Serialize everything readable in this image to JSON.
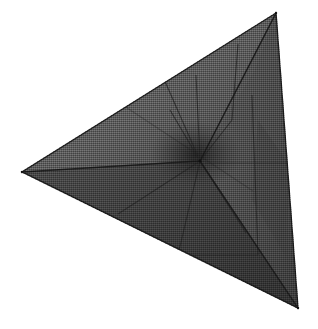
{
  "scene": {
    "title": "Shaded tetrahedron wireframe render",
    "object_name": "tetrahedron",
    "render_style": "flat-shaded-dithered",
    "background_color": "#ffffff",
    "canvas_width": 318,
    "canvas_height": 329
  },
  "geometry": {
    "outline_points": "276,13 22,172 298,308",
    "vertices": [
      {
        "name": "apex-top",
        "x": 276,
        "y": 13
      },
      {
        "name": "vertex-left",
        "x": 22,
        "y": 172
      },
      {
        "name": "vertex-bottom-right",
        "x": 298,
        "y": 308
      },
      {
        "name": "vertex-center-interior",
        "x": 200,
        "y": 161
      }
    ],
    "silhouette_edges": [
      {
        "name": "edge-top-left",
        "from": [
          276,
          13
        ],
        "to": [
          22,
          172
        ]
      },
      {
        "name": "edge-left-bottom",
        "from": [
          22,
          172
        ],
        "to": [
          298,
          308
        ]
      },
      {
        "name": "edge-right",
        "from": [
          298,
          308
        ],
        "to": [
          276,
          13
        ]
      }
    ],
    "interior_edges": [
      {
        "name": "spoke-center-to-left",
        "from": [
          200,
          161
        ],
        "to": [
          22,
          172
        ]
      },
      {
        "name": "spoke-center-to-top",
        "from": [
          200,
          161
        ],
        "to": [
          276,
          13
        ]
      },
      {
        "name": "spoke-center-to-bottom-right",
        "from": [
          200,
          161
        ],
        "to": [
          298,
          308
        ]
      }
    ],
    "subdivision_lines": [
      {
        "name": "subdiv-upper-a",
        "from": [
          149,
          45
        ],
        "to": [
          200,
          161
        ]
      },
      {
        "name": "subdiv-upper-b",
        "from": [
          196,
          75
        ],
        "to": [
          200,
          161
        ]
      },
      {
        "name": "subdiv-upper-c",
        "from": [
          238,
          44
        ],
        "to": [
          232,
          120
        ]
      },
      {
        "name": "subdiv-right-vertical",
        "from": [
          252,
          95
        ],
        "to": [
          258,
          255
        ]
      },
      {
        "name": "subdiv-cross-right",
        "from": [
          205,
          163
        ],
        "to": [
          288,
          163
        ]
      },
      {
        "name": "subdiv-lower-a",
        "from": [
          200,
          161
        ],
        "to": [
          178,
          255
        ]
      },
      {
        "name": "subdiv-lower-b",
        "from": [
          200,
          161
        ],
        "to": [
          118,
          214
        ]
      },
      {
        "name": "subdiv-lower-c",
        "from": [
          200,
          161
        ],
        "to": [
          246,
          233
        ]
      },
      {
        "name": "subdiv-lower-d",
        "from": [
          178,
          255
        ],
        "to": [
          258,
          255
        ]
      },
      {
        "name": "subdiv-upper-fan-a",
        "from": [
          200,
          161
        ],
        "to": [
          232,
          120
        ]
      },
      {
        "name": "subdiv-upper-fan-b",
        "from": [
          200,
          161
        ],
        "to": [
          170,
          110
        ]
      },
      {
        "name": "subdiv-band-upper",
        "from": [
          109,
          96
        ],
        "to": [
          253,
          191
        ]
      }
    ]
  },
  "shading": {
    "face_upper_left_color": "#5e5e5e",
    "face_upper_right_color": "#545454",
    "face_lower_color": "#3c3c3c",
    "face_right_color": "#4a4a4a",
    "center_shadow_color": "#2a2a2a",
    "edge_line_color": "#262626",
    "silhouette_line_color": "#1c1c1c",
    "highlight_color": "#6b6b6b"
  }
}
